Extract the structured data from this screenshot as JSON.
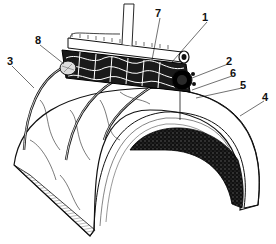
{
  "figure": {
    "type": "anatomical line drawing",
    "labels": [
      {
        "id": "1",
        "text": "1",
        "x": 202,
        "y": 12,
        "tx": 172,
        "ty": 62
      },
      {
        "id": "2",
        "text": "2",
        "x": 226,
        "y": 56,
        "tx": 190,
        "ty": 78
      },
      {
        "id": "3",
        "text": "3",
        "x": 7,
        "y": 56,
        "tx": 34,
        "ty": 88
      },
      {
        "id": "4",
        "text": "4",
        "x": 262,
        "y": 92,
        "tx": 240,
        "ty": 116
      },
      {
        "id": "5",
        "text": "5",
        "x": 240,
        "y": 80,
        "tx": 196,
        "ty": 98
      },
      {
        "id": "6",
        "text": "6",
        "x": 230,
        "y": 68,
        "tx": 192,
        "ty": 90
      },
      {
        "id": "7",
        "text": "7",
        "x": 155,
        "y": 8,
        "tx": 152,
        "ty": 60
      },
      {
        "id": "8",
        "text": "8",
        "x": 35,
        "y": 35,
        "tx": 64,
        "ty": 64
      }
    ]
  }
}
